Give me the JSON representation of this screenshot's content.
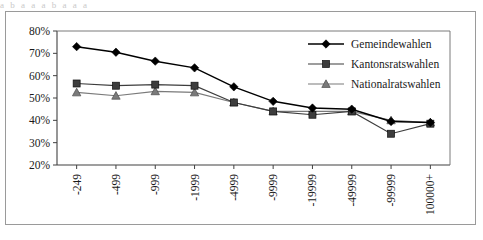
{
  "figure": {
    "outer_border_color": "#9a9a9a",
    "background": "#ffffff",
    "partial_text_above": "a b  a    a   a b a     a   a"
  },
  "chart_data": {
    "type": "line",
    "title": "",
    "subtitle": "",
    "xlabel": "",
    "ylabel": "",
    "categories": [
      "-249",
      "-499",
      "-999",
      "-1999",
      "-4999",
      "-9999",
      "-19999",
      "-49999",
      "-99999",
      "100000+"
    ],
    "ylim": [
      20,
      80
    ],
    "ytick_labels": [
      "20%",
      "30%",
      "40%",
      "50%",
      "60%",
      "70%",
      "80%"
    ],
    "ytick_values": [
      20,
      30,
      40,
      50,
      60,
      70,
      80
    ],
    "grid": false,
    "legend_position": "top-right",
    "series": [
      {
        "name": "Gemeindewahlen",
        "marker": "diamond",
        "color": "#000000",
        "line_style": "solid",
        "values": [
          73,
          70.5,
          66.5,
          63.5,
          55,
          48.5,
          45.5,
          45,
          39.5,
          39
        ]
      },
      {
        "name": "Kantonsratswahlen",
        "marker": "square",
        "color": "#3d3d3d",
        "line_style": "solid",
        "values": [
          56.5,
          55.5,
          56,
          55.5,
          48,
          44,
          42.5,
          44,
          34,
          38.5
        ]
      },
      {
        "name": "Nationalratswahlen",
        "marker": "triangle",
        "color": "#7a7a7a",
        "line_style": "solid",
        "values": [
          52.5,
          51,
          53,
          52.5,
          48,
          44,
          44,
          44,
          40,
          39
        ]
      }
    ]
  },
  "axis": {
    "y_axis_name": "percent-axis",
    "x_axis_name": "municipality-size-axis"
  }
}
